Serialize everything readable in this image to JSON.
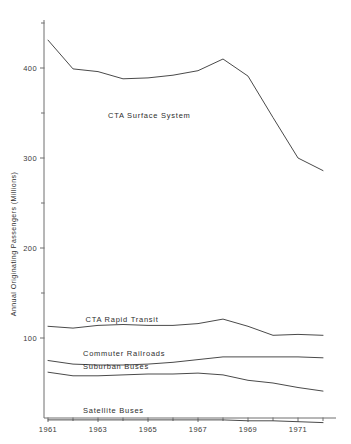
{
  "chart_data": {
    "type": "line",
    "title": "",
    "xlabel": "",
    "ylabel": "Annual Originating Passengers (Millions)",
    "xlim": [
      1960.5,
      1972.6
    ],
    "ylim": [
      0,
      447
    ],
    "grid": false,
    "legend": "inline-labels",
    "x_ticks_major": [
      1961,
      1963,
      1965,
      1967,
      1969,
      1971
    ],
    "x_tick_labels": [
      "1961",
      "1963",
      "1965",
      "1967",
      "1969",
      "1971"
    ],
    "x_ticks_minor": [
      1962,
      1964,
      1966,
      1968,
      1970,
      1972
    ],
    "y_ticks_major": [
      100,
      200,
      300,
      400
    ],
    "y_tick_labels": [
      "100",
      "200",
      "300",
      "400"
    ],
    "y_ticks_minor": [
      150,
      250,
      350,
      450
    ],
    "x": [
      1961,
      1962,
      1963,
      1964,
      1965,
      1966,
      1967,
      1968,
      1969,
      1970,
      1971,
      1972
    ],
    "series": [
      {
        "name": "CTA Surface System",
        "label": "CTA Surface System",
        "label_x": 1963.4,
        "label_y": 345,
        "values": [
          431,
          399,
          396,
          388,
          389,
          392,
          397,
          410,
          391,
          345,
          300,
          286
        ]
      },
      {
        "name": "CTA Rapid Transit",
        "label": "CTA Rapid Transit",
        "label_x": 1962.5,
        "label_y": 118,
        "values": [
          113,
          111,
          114,
          115,
          114,
          114,
          116,
          121,
          113,
          103,
          104,
          103
        ]
      },
      {
        "name": "Commuter Railroads",
        "label": "Commuter Railroads",
        "label_x": 1962.4,
        "label_y": 80,
        "values": [
          75,
          71,
          70,
          70,
          71,
          73,
          76,
          79,
          79,
          79,
          79,
          78
        ]
      },
      {
        "name": "Suburban Buses",
        "label": "Suburban Buses",
        "label_x": 1962.4,
        "label_y": 66,
        "values": [
          62,
          58,
          58,
          59,
          60,
          60,
          61,
          59,
          53,
          50,
          45,
          41
        ]
      },
      {
        "name": "Satellite Buses",
        "label": "Satellite Buses",
        "label_x": 1962.4,
        "label_y": 17,
        "values": [
          9,
          9,
          9,
          9,
          9,
          9,
          9,
          9,
          8,
          8,
          7,
          6
        ]
      }
    ]
  }
}
